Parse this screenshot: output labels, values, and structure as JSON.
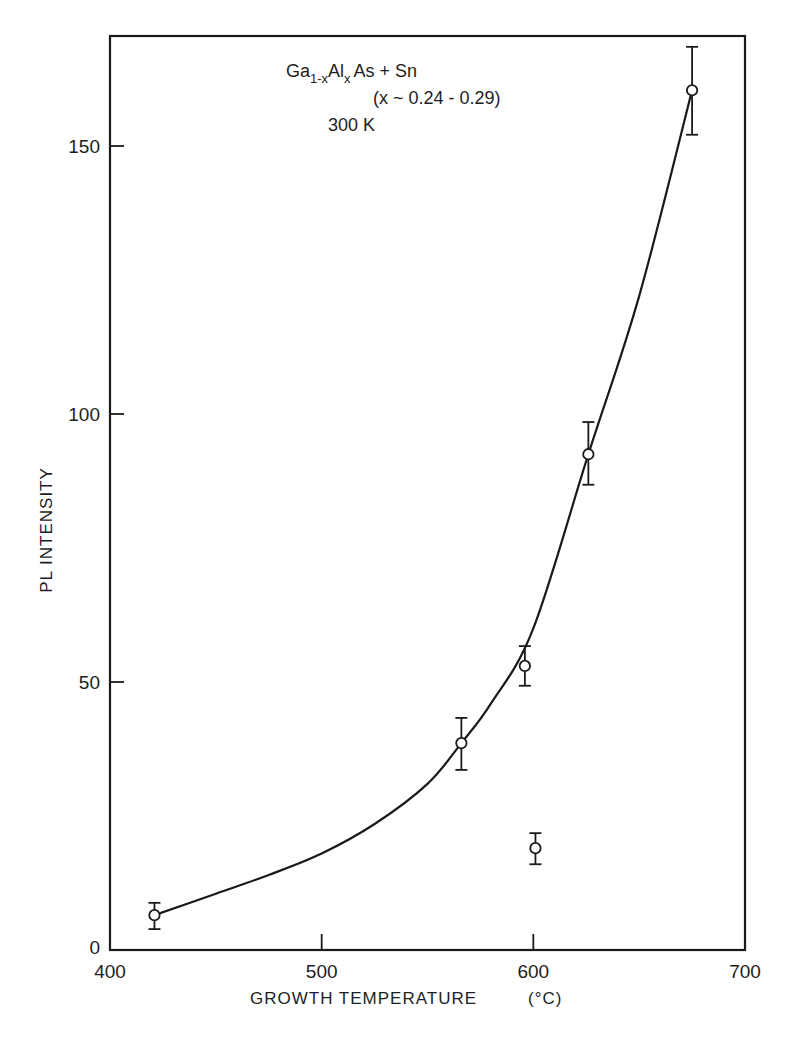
{
  "chart_data": {
    "type": "scatter",
    "title": "",
    "xlabel": "GROWTH TEMPERATURE",
    "xlabel_unit": "(°C)",
    "ylabel": "PL INTENSITY",
    "xlim": [
      400,
      700
    ],
    "ylim": [
      0,
      170
    ],
    "x_ticks": [
      400,
      500,
      600,
      700
    ],
    "y_ticks": [
      0,
      50,
      100,
      150
    ],
    "grid": false,
    "legend": null,
    "annotations": {
      "line1_main": "Ga",
      "line1_sub1": "1-x",
      "line1_mid": "Al",
      "line1_sub2": "x",
      "line1_tail": "As + Sn",
      "line2": "(x ~ 0.24 - 0.29)",
      "line3": "300 K"
    },
    "series": [
      {
        "name": "measured",
        "marker": "open-circle",
        "points": [
          {
            "x": 421,
            "y": 6.5,
            "err_low": 3.9,
            "err_high": 8.8
          },
          {
            "x": 566,
            "y": 38.6,
            "err_low": 33.6,
            "err_high": 43.3
          },
          {
            "x": 596,
            "y": 53,
            "err_low": 49.3,
            "err_high": 56.7
          },
          {
            "x": 601,
            "y": 19,
            "err_low": 16,
            "err_high": 21.8
          },
          {
            "x": 626,
            "y": 92.5,
            "err_low": 86.8,
            "err_high": 98.5
          },
          {
            "x": 675,
            "y": 160.4,
            "err_low": 152.1,
            "err_high": 168.5
          }
        ]
      },
      {
        "name": "fit curve",
        "type": "line",
        "x": [
          421,
          450,
          475,
          500,
          525,
          550,
          566,
          580,
          600,
          626,
          650,
          675
        ],
        "y": [
          6.5,
          10.5,
          14,
          18,
          23.5,
          31,
          38.6,
          46,
          60,
          92.5,
          122,
          160.4
        ]
      }
    ]
  },
  "labels": {
    "x_ticks": [
      "400",
      "500",
      "600",
      "700"
    ],
    "y_ticks": [
      "0",
      "50",
      "100",
      "150"
    ]
  }
}
